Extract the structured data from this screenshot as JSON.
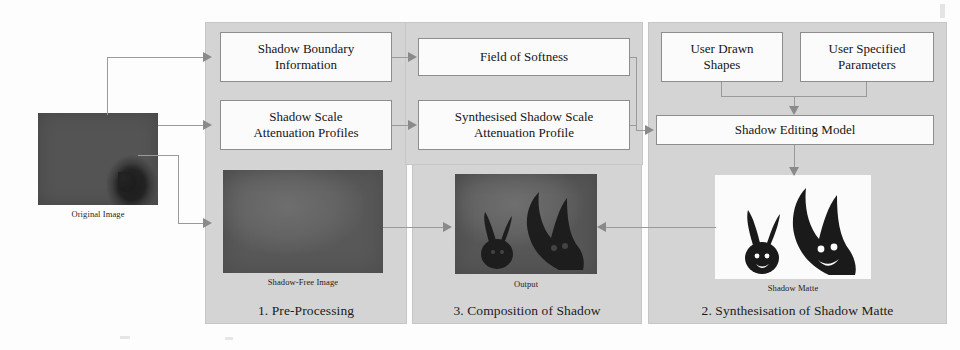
{
  "diagram": {
    "background_color": "#fdfdfd",
    "panel_color": "#d4d4d4",
    "box_color": "#fbfbfb",
    "connector_color": "#9a9a9a"
  },
  "panels": [
    {
      "id": "pre-processing",
      "caption": "1. Pre-Processing"
    },
    {
      "id": "composition",
      "caption": "3. Composition of Shadow"
    },
    {
      "id": "synthesisation",
      "caption": "2. Synthesisation of Shadow Matte"
    }
  ],
  "boxes": [
    {
      "id": "shadow-boundary-information",
      "line1": "Shadow Boundary",
      "line2": "Information"
    },
    {
      "id": "field-of-softness",
      "line1": "Field of Softness",
      "line2": ""
    },
    {
      "id": "shadow-scale-attenuation-profiles",
      "line1": "Shadow Scale",
      "line2": "Attenuation Profiles"
    },
    {
      "id": "synthesised-shadow-scale-attenuation-profile",
      "line1": "Synthesised Shadow Scale",
      "line2": "Attenuation Profile"
    },
    {
      "id": "user-drawn-shapes",
      "line1": "User Drawn",
      "line2": "Shapes"
    },
    {
      "id": "user-specified-parameters",
      "line1": "User Specified",
      "line2": "Parameters"
    },
    {
      "id": "shadow-editing-model",
      "line1": "Shadow Editing Model",
      "line2": ""
    }
  ],
  "images": [
    {
      "id": "original-image",
      "caption": "Original Image"
    },
    {
      "id": "shadow-free-image",
      "caption": "Shadow-Free Image"
    },
    {
      "id": "output-image",
      "caption": "Output"
    },
    {
      "id": "shadow-matte",
      "caption": "Shadow Matte"
    }
  ]
}
